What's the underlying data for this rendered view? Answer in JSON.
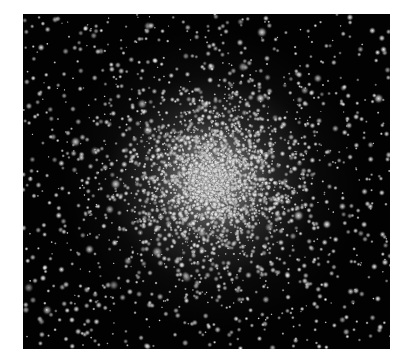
{
  "image": {
    "subject": "globular star cluster",
    "background_color": "#ffffff",
    "frame": {
      "x": 23,
      "y": 14,
      "width": 367,
      "height": 335,
      "color": "#020202"
    },
    "core": {
      "cx": 189,
      "cy": 166,
      "color": "#ebebeb"
    },
    "stars": {
      "count_field": 900,
      "count_cluster": 3200,
      "seed": 42,
      "color": "#f2f2f2"
    }
  }
}
